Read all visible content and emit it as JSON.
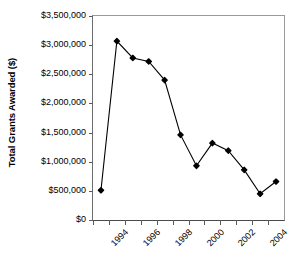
{
  "chart_data": {
    "type": "line",
    "title": "",
    "xlabel": "",
    "ylabel": "Total Grants Awarded ($)",
    "grid": false,
    "legend": false,
    "legend_position": "none",
    "marker": "filled-diamond",
    "line_color": "#000000",
    "marker_color": "#000000",
    "xlim": [
      1994,
      1996
    ],
    "ylim": [
      0,
      3500000
    ],
    "y_ticks": [
      0,
      500000,
      1000000,
      1500000,
      2000000,
      2500000,
      3000000,
      3500000
    ],
    "y_tick_labels": [
      "$0",
      "$500,000",
      "$1,000,000",
      "$1,500,000",
      "$2,000,000",
      "$2,500,000",
      "$3,000,000",
      "$3,500,000"
    ],
    "x_ticks": [
      1994,
      1995,
      1996,
      1997,
      1998,
      1999,
      2000,
      2001,
      2002,
      2003,
      2004,
      2005
    ],
    "x_tick_labels": [
      "1994",
      "",
      "1996",
      "",
      "1998",
      "",
      "2000",
      "",
      "2002",
      "",
      "2004",
      ""
    ],
    "x_axis_min": 1994,
    "x_axis_max": 2006,
    "x": [
      1994.5,
      1995.5,
      1996.5,
      1997.5,
      1998.5,
      1999.5,
      2000.5,
      2001.5,
      2002.5,
      2003.5,
      2004.5,
      2005.5
    ],
    "values": [
      510000,
      3070000,
      2780000,
      2720000,
      2400000,
      1460000,
      930000,
      1320000,
      1190000,
      860000,
      450000,
      660000
    ],
    "series": [
      {
        "name": "Total Grants Awarded",
        "values": [
          510000,
          3070000,
          2780000,
          2720000,
          2400000,
          1460000,
          930000,
          1320000,
          1190000,
          860000,
          450000,
          660000
        ]
      }
    ]
  }
}
